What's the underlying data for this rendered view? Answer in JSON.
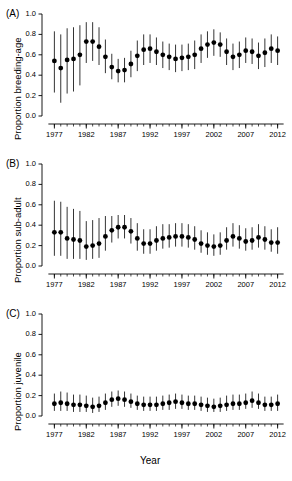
{
  "figure": {
    "xlabel": "Year",
    "panels": [
      {
        "tag": "(A)",
        "ylabel": "Proportion breeding-age",
        "ytitle_short": "breeding-age"
      },
      {
        "tag": "(B)",
        "ylabel": "Proportion sub-adult",
        "ytitle_short": "sub-adult"
      },
      {
        "tag": "(C)",
        "ylabel": "Proportion juvenile",
        "ytitle_short": "juvenile"
      }
    ],
    "yticks": [
      "0.0",
      "0.2",
      "0.4",
      "0.6",
      "0.8",
      "1.0"
    ],
    "xticks": [
      "1977",
      "1982",
      "1987",
      "1992",
      "1997",
      "2002",
      "2007",
      "2012"
    ],
    "marker_color": "#000000",
    "error_bar_color": "#000000",
    "axis_color": "#000000",
    "background_color": "#ffffff"
  },
  "chart_data": [
    {
      "type": "scatter",
      "title": "(A)",
      "xlabel": "Year",
      "ylabel": "Proportion breeding-age",
      "xlim": [
        1976,
        2013
      ],
      "ylim": [
        0.0,
        1.0
      ],
      "yticks": [
        0.0,
        0.2,
        0.4,
        0.6,
        0.8,
        1.0
      ],
      "xticks": [
        1977,
        1982,
        1987,
        1992,
        1997,
        2002,
        2007,
        2012
      ],
      "grid": false,
      "legend": "none",
      "x": [
        1977,
        1978,
        1979,
        1980,
        1981,
        1982,
        1983,
        1984,
        1985,
        1986,
        1987,
        1988,
        1989,
        1990,
        1991,
        1992,
        1993,
        1994,
        1995,
        1996,
        1997,
        1998,
        1999,
        2000,
        2001,
        2002,
        2003,
        2004,
        2005,
        2006,
        2007,
        2008,
        2009,
        2010,
        2011,
        2012
      ],
      "values": [
        0.54,
        0.47,
        0.55,
        0.56,
        0.6,
        0.73,
        0.73,
        0.68,
        0.58,
        0.48,
        0.44,
        0.45,
        0.51,
        0.59,
        0.65,
        0.66,
        0.63,
        0.6,
        0.58,
        0.56,
        0.57,
        0.58,
        0.6,
        0.66,
        0.7,
        0.72,
        0.7,
        0.63,
        0.58,
        0.6,
        0.64,
        0.63,
        0.59,
        0.62,
        0.66,
        0.64
      ],
      "err_low": [
        0.23,
        0.13,
        0.22,
        0.24,
        0.3,
        0.52,
        0.54,
        0.5,
        0.42,
        0.36,
        0.33,
        0.33,
        0.38,
        0.44,
        0.5,
        0.52,
        0.5,
        0.47,
        0.45,
        0.43,
        0.44,
        0.45,
        0.46,
        0.52,
        0.57,
        0.59,
        0.58,
        0.5,
        0.45,
        0.47,
        0.52,
        0.51,
        0.46,
        0.48,
        0.52,
        0.5
      ],
      "err_high": [
        0.83,
        0.8,
        0.86,
        0.87,
        0.89,
        0.92,
        0.92,
        0.87,
        0.75,
        0.61,
        0.56,
        0.57,
        0.64,
        0.74,
        0.8,
        0.8,
        0.77,
        0.73,
        0.71,
        0.7,
        0.7,
        0.71,
        0.74,
        0.8,
        0.83,
        0.85,
        0.82,
        0.76,
        0.71,
        0.73,
        0.77,
        0.76,
        0.72,
        0.76,
        0.8,
        0.78
      ]
    },
    {
      "type": "scatter",
      "title": "(B)",
      "xlabel": "Year",
      "ylabel": "Proportion sub-adult",
      "xlim": [
        1976,
        2013
      ],
      "ylim": [
        0.0,
        1.0
      ],
      "yticks": [
        0.0,
        0.2,
        0.4,
        0.6,
        0.8,
        1.0
      ],
      "xticks": [
        1977,
        1982,
        1987,
        1992,
        1997,
        2002,
        2007,
        2012
      ],
      "grid": false,
      "legend": "none",
      "x": [
        1977,
        1978,
        1979,
        1980,
        1981,
        1982,
        1983,
        1984,
        1985,
        1986,
        1987,
        1988,
        1989,
        1990,
        1991,
        1992,
        1993,
        1994,
        1995,
        1996,
        1997,
        1998,
        1999,
        2000,
        2001,
        2002,
        2003,
        2004,
        2005,
        2006,
        2007,
        2008,
        2009,
        2010,
        2011,
        2012
      ],
      "values": [
        0.33,
        0.33,
        0.27,
        0.26,
        0.25,
        0.19,
        0.2,
        0.22,
        0.29,
        0.35,
        0.38,
        0.38,
        0.34,
        0.27,
        0.22,
        0.22,
        0.25,
        0.27,
        0.28,
        0.29,
        0.29,
        0.28,
        0.26,
        0.22,
        0.2,
        0.19,
        0.2,
        0.25,
        0.29,
        0.27,
        0.24,
        0.25,
        0.28,
        0.26,
        0.23,
        0.23
      ],
      "err_low": [
        0.1,
        0.1,
        0.07,
        0.07,
        0.07,
        0.06,
        0.07,
        0.08,
        0.15,
        0.23,
        0.27,
        0.27,
        0.22,
        0.15,
        0.12,
        0.12,
        0.15,
        0.17,
        0.18,
        0.19,
        0.19,
        0.18,
        0.16,
        0.13,
        0.11,
        0.1,
        0.11,
        0.16,
        0.19,
        0.17,
        0.15,
        0.16,
        0.18,
        0.16,
        0.14,
        0.12
      ],
      "err_high": [
        0.64,
        0.63,
        0.58,
        0.56,
        0.54,
        0.44,
        0.45,
        0.47,
        0.49,
        0.49,
        0.5,
        0.5,
        0.47,
        0.42,
        0.36,
        0.36,
        0.39,
        0.41,
        0.41,
        0.42,
        0.42,
        0.41,
        0.39,
        0.35,
        0.33,
        0.31,
        0.33,
        0.38,
        0.42,
        0.4,
        0.37,
        0.38,
        0.41,
        0.39,
        0.36,
        0.38
      ]
    },
    {
      "type": "scatter",
      "title": "(C)",
      "xlabel": "Year",
      "ylabel": "Proportion juvenile",
      "xlim": [
        1976,
        2013
      ],
      "ylim": [
        0.0,
        1.0
      ],
      "yticks": [
        0.0,
        0.2,
        0.4,
        0.6,
        0.8,
        1.0
      ],
      "xticks": [
        1977,
        1982,
        1987,
        1992,
        1997,
        2002,
        2007,
        2012
      ],
      "grid": false,
      "legend": "none",
      "x": [
        1977,
        1978,
        1979,
        1980,
        1981,
        1982,
        1983,
        1984,
        1985,
        1986,
        1987,
        1988,
        1989,
        1990,
        1991,
        1992,
        1993,
        1994,
        1995,
        1996,
        1997,
        1998,
        1999,
        2000,
        2001,
        2002,
        2003,
        2004,
        2005,
        2006,
        2007,
        2008,
        2009,
        2010,
        2011,
        2012
      ],
      "values": [
        0.12,
        0.13,
        0.12,
        0.11,
        0.11,
        0.1,
        0.09,
        0.1,
        0.13,
        0.16,
        0.17,
        0.16,
        0.14,
        0.12,
        0.11,
        0.11,
        0.11,
        0.12,
        0.13,
        0.14,
        0.13,
        0.12,
        0.12,
        0.11,
        0.1,
        0.09,
        0.1,
        0.11,
        0.12,
        0.12,
        0.13,
        0.15,
        0.13,
        0.11,
        0.11,
        0.12
      ],
      "err_low": [
        0.05,
        0.05,
        0.05,
        0.04,
        0.04,
        0.04,
        0.03,
        0.04,
        0.06,
        0.09,
        0.1,
        0.09,
        0.08,
        0.06,
        0.05,
        0.05,
        0.05,
        0.06,
        0.06,
        0.07,
        0.07,
        0.06,
        0.06,
        0.05,
        0.04,
        0.04,
        0.04,
        0.05,
        0.06,
        0.06,
        0.07,
        0.08,
        0.07,
        0.05,
        0.05,
        0.05
      ],
      "err_high": [
        0.22,
        0.24,
        0.23,
        0.21,
        0.21,
        0.2,
        0.18,
        0.19,
        0.22,
        0.24,
        0.25,
        0.24,
        0.22,
        0.2,
        0.19,
        0.19,
        0.19,
        0.2,
        0.21,
        0.22,
        0.21,
        0.2,
        0.2,
        0.19,
        0.18,
        0.17,
        0.18,
        0.2,
        0.21,
        0.21,
        0.22,
        0.24,
        0.22,
        0.19,
        0.19,
        0.21
      ]
    }
  ]
}
